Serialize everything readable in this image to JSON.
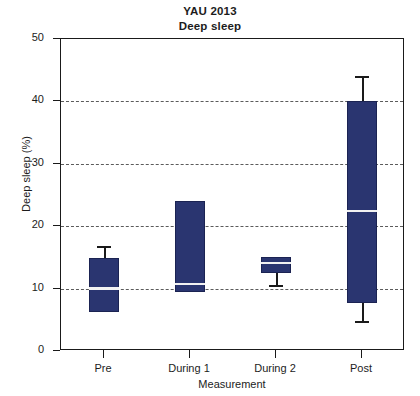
{
  "chart_data": {
    "type": "box",
    "title": "YAU 2013",
    "subtitle": "Deep sleep",
    "xlabel": "Measurement",
    "ylabel": "Deep sleep (%)",
    "ylim": [
      0,
      50
    ],
    "ytick_labels": [
      "0",
      "10",
      "20",
      "30",
      "40",
      "50"
    ],
    "ytick_values": [
      0,
      10,
      20,
      30,
      40,
      50
    ],
    "gridlines_y": [
      10,
      20,
      30,
      40
    ],
    "grid": true,
    "legend": "none",
    "categories": [
      "Pre",
      "During 1",
      "During 2",
      "Post"
    ],
    "box_color": "#2a3570",
    "median_color": "#f2f2f2",
    "whisker_color": "#1a1a1a",
    "boxes": [
      {
        "category": "Pre",
        "whisker_low": 6.3,
        "q1": 6.3,
        "median": 10.0,
        "q3": 14.9,
        "whisker_high": 16.8
      },
      {
        "category": "During 1",
        "whisker_low": 9.5,
        "q1": 9.5,
        "median": 10.7,
        "q3": 24.0,
        "whisker_high": 24.0
      },
      {
        "category": "During 2",
        "whisker_low": 10.6,
        "q1": 12.5,
        "median": 14.1,
        "q3": 15.0,
        "whisker_high": 15.0
      },
      {
        "category": "Post",
        "whisker_low": 4.8,
        "q1": 7.7,
        "median": 22.4,
        "q3": 40.1,
        "whisker_high": 44.1
      }
    ]
  }
}
